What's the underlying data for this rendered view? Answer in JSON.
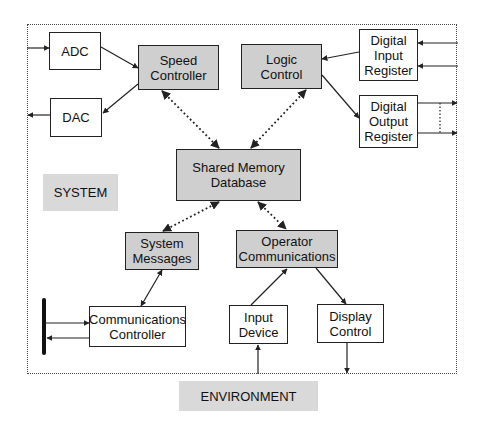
{
  "diagram": {
    "boundary_label": "SYSTEM",
    "environment_label": "ENVIRONMENT",
    "nodes": {
      "adc": {
        "label": "ADC",
        "shaded": false
      },
      "dac": {
        "label": "DAC",
        "shaded": false
      },
      "speed_controller": {
        "label": "Speed\nController",
        "shaded": true
      },
      "logic_control": {
        "label": "Logic\nControl",
        "shaded": true
      },
      "digital_input_register": {
        "label": "Digital\nInput\nRegister",
        "shaded": false
      },
      "digital_output_register": {
        "label": "Digital\nOutput\nRegister",
        "shaded": false
      },
      "shared_memory": {
        "label": "Shared Memory\nDatabase",
        "shaded": true
      },
      "system_messages": {
        "label": "System\nMessages",
        "shaded": true
      },
      "operator_communications": {
        "label": "Operator\nCommunications",
        "shaded": true
      },
      "communications_controller": {
        "label": "Communications\nController",
        "shaded": false
      },
      "input_device": {
        "label": "Input\nDevice",
        "shaded": false
      },
      "display_control": {
        "label": "Display\nControl",
        "shaded": false
      }
    },
    "edges": [
      {
        "from": "environment",
        "to": "ADC",
        "style": "solid"
      },
      {
        "from": "ADC",
        "to": "Speed Controller",
        "style": "solid"
      },
      {
        "from": "Speed Controller",
        "to": "DAC",
        "style": "solid"
      },
      {
        "from": "DAC",
        "to": "environment",
        "style": "solid"
      },
      {
        "from": "environment",
        "to": "Digital Input Register",
        "style": "solid",
        "count": 2
      },
      {
        "from": "Digital Input Register",
        "to": "Logic Control",
        "style": "solid"
      },
      {
        "from": "Logic Control",
        "to": "Digital Output Register",
        "style": "solid"
      },
      {
        "from": "Digital Output Register",
        "to": "environment",
        "style": "solid",
        "count": 2
      },
      {
        "from": "Speed Controller",
        "to": "Shared Memory Database",
        "style": "dotted",
        "bidirectional": true
      },
      {
        "from": "Logic Control",
        "to": "Shared Memory Database",
        "style": "dotted",
        "bidirectional": true
      },
      {
        "from": "Shared Memory Database",
        "to": "System Messages",
        "style": "dotted",
        "bidirectional": true
      },
      {
        "from": "Shared Memory Database",
        "to": "Operator Communications",
        "style": "dotted",
        "bidirectional": true
      },
      {
        "from": "System Messages",
        "to": "Communications Controller",
        "style": "solid",
        "bidirectional": true
      },
      {
        "from": "bus",
        "to": "Communications Controller",
        "style": "solid"
      },
      {
        "from": "Communications Controller",
        "to": "bus",
        "style": "solid"
      },
      {
        "from": "Input Device",
        "to": "Operator Communications",
        "style": "solid"
      },
      {
        "from": "Operator Communications",
        "to": "Display Control",
        "style": "solid"
      },
      {
        "from": "environment",
        "to": "Input Device",
        "style": "solid"
      },
      {
        "from": "Display Control",
        "to": "environment",
        "style": "solid"
      }
    ]
  }
}
